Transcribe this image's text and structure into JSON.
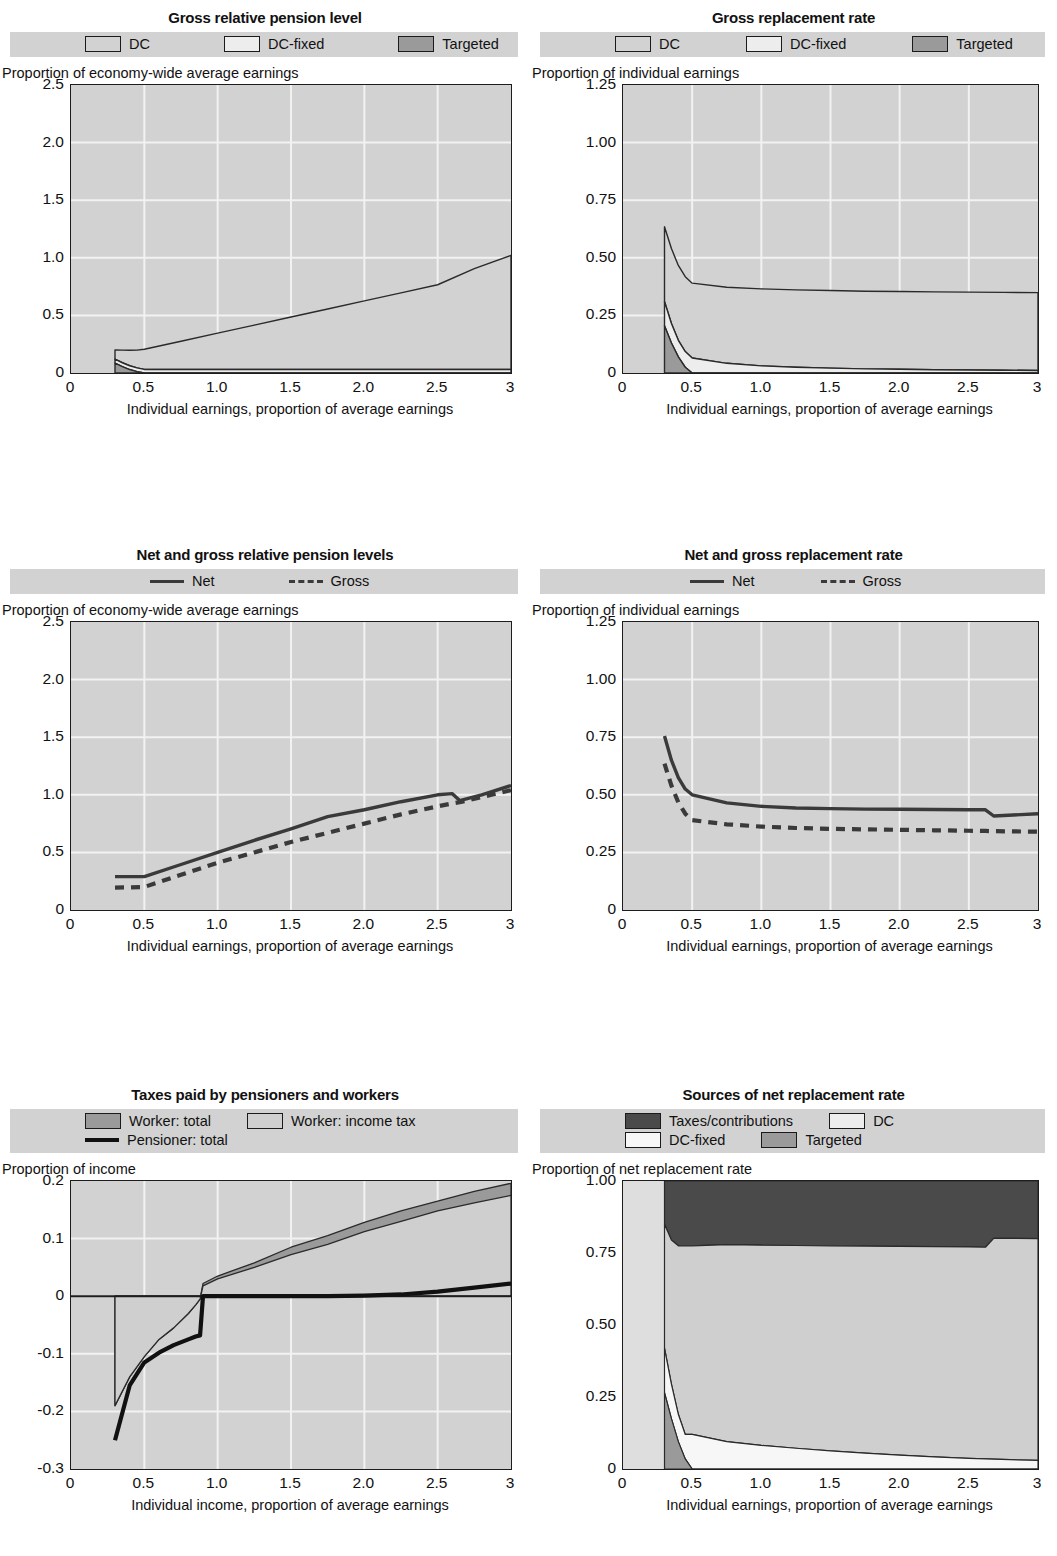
{
  "colors": {
    "page_bg": "#ffffff",
    "plot_bg": "#d2d2d2",
    "legend_bg": "#d2d2d2",
    "grid": "#f2f2f2",
    "axis": "#1d1d1d",
    "dc": "#d2d2d2",
    "dc_fixed": "#ededed",
    "targeted": "#9a9a9a",
    "taxes": "#4a4a4a",
    "worker_total": "#9a9a9a",
    "worker_income_tax": "#cfcfcf",
    "line_net": "#3a3a3a",
    "line_gross": "#3a3a3a",
    "line_pensioner": "#111111"
  },
  "panels": [
    {
      "id": "gross-relative-pension-level",
      "title": "Gross relative pension level",
      "legend_rows": [
        [
          {
            "label": "DC",
            "mark": "swatch",
            "fill": "#d2d2d2"
          },
          {
            "label": "DC-fixed",
            "mark": "swatch",
            "fill": "#ededed"
          },
          {
            "label": "Targeted",
            "mark": "swatch",
            "fill": "#9a9a9a"
          }
        ]
      ],
      "ylabel": "Proportion of economy-wide average earnings",
      "xlabel": "Individual earnings, proportion of average earnings"
    },
    {
      "id": "gross-replacement-rate",
      "title": "Gross replacement rate",
      "legend_rows": [
        [
          {
            "label": "DC",
            "mark": "swatch",
            "fill": "#d2d2d2"
          },
          {
            "label": "DC-fixed",
            "mark": "swatch",
            "fill": "#ededed"
          },
          {
            "label": "Targeted",
            "mark": "swatch",
            "fill": "#9a9a9a"
          }
        ]
      ],
      "ylabel": "Proportion of individual earnings",
      "xlabel": "Individual earnings, proportion of average earnings"
    },
    {
      "id": "net-and-gross-relative-pension-levels",
      "title": "Net and gross relative pension levels",
      "legend_rows": [
        [
          {
            "label": "Net",
            "mark": "line",
            "fill": "#3a3a3a"
          },
          {
            "label": "Gross",
            "mark": "dash",
            "fill": "#3a3a3a"
          }
        ]
      ],
      "ylabel": "Proportion of economy-wide average earnings",
      "xlabel": "Individual earnings, proportion of average earnings"
    },
    {
      "id": "net-and-gross-replacement-rate",
      "title": "Net and gross replacement rate",
      "legend_rows": [
        [
          {
            "label": "Net",
            "mark": "line",
            "fill": "#3a3a3a"
          },
          {
            "label": "Gross",
            "mark": "dash",
            "fill": "#3a3a3a"
          }
        ]
      ],
      "ylabel": "Proportion of individual earnings",
      "xlabel": "Individual earnings, proportion of average earnings"
    },
    {
      "id": "taxes-paid-by-pensioners-and-workers",
      "title": "Taxes paid by pensioners and workers",
      "legend_rows": [
        [
          {
            "label": "Worker: total",
            "mark": "swatch",
            "fill": "#9a9a9a"
          },
          {
            "label": "Worker: income tax",
            "mark": "swatch",
            "fill": "#cfcfcf"
          }
        ],
        [
          {
            "label": "Pensioner: total",
            "mark": "thickline",
            "fill": "#111111"
          }
        ]
      ],
      "ylabel": "Proportion of income",
      "xlabel": "Individual income, proportion of average earnings"
    },
    {
      "id": "sources-of-net-replacement-rate",
      "title": "Sources of net replacement rate",
      "legend_rows": [
        [
          {
            "label": "Taxes/contributions",
            "mark": "swatch",
            "fill": "#4a4a4a"
          },
          {
            "label": "DC",
            "mark": "swatch",
            "fill": "#ededed"
          }
        ],
        [
          {
            "label": "DC-fixed",
            "mark": "swatch",
            "fill": "#f7f7f7"
          },
          {
            "label": "Targeted",
            "mark": "swatch",
            "fill": "#9a9a9a"
          }
        ]
      ],
      "ylabel": "Proportion of net replacement rate",
      "xlabel": "Individual earnings, proportion of average earnings"
    }
  ],
  "chart_data": [
    {
      "type": "area",
      "id": "gross-relative-pension-level",
      "title": "Gross relative pension level",
      "xlabel": "Individual earnings, proportion of average earnings",
      "ylabel": "Proportion of economy-wide average earnings",
      "xlim": [
        0,
        3
      ],
      "ylim": [
        0,
        2.5
      ],
      "xticks": [
        0,
        0.5,
        1.0,
        1.5,
        2.0,
        2.5,
        3
      ],
      "xticklabels": [
        "0",
        "0.5",
        "1.0",
        "1.5",
        "2.0",
        "2.5",
        "3"
      ],
      "yticks": [
        0,
        0.5,
        1.0,
        1.5,
        2.0,
        2.5
      ],
      "yticklabels": [
        "0",
        "0.5",
        "1.0",
        "1.5",
        "2.0",
        "2.5"
      ],
      "grid": true,
      "stacked": true,
      "legend_position": "above",
      "x": [
        0.3,
        0.35,
        0.4,
        0.45,
        0.5,
        0.75,
        1.0,
        1.25,
        1.5,
        1.75,
        2.0,
        2.25,
        2.5,
        2.75,
        3.0
      ],
      "series": [
        {
          "name": "Targeted",
          "values": [
            0.085,
            0.055,
            0.03,
            0.012,
            0.0,
            0.0,
            0.0,
            0.0,
            0.0,
            0.0,
            0.0,
            0.0,
            0.0,
            0.0,
            0.0
          ]
        },
        {
          "name": "DC-fixed",
          "values": [
            0.035,
            0.034,
            0.033,
            0.032,
            0.031,
            0.031,
            0.031,
            0.031,
            0.031,
            0.031,
            0.031,
            0.031,
            0.031,
            0.031,
            0.031
          ]
        },
        {
          "name": "DC",
          "values": [
            0.08,
            0.11,
            0.135,
            0.155,
            0.175,
            0.245,
            0.315,
            0.385,
            0.455,
            0.525,
            0.595,
            0.665,
            0.735,
            0.875,
            0.99
          ]
        }
      ],
      "totals": [
        0.2,
        0.199,
        0.198,
        0.199,
        0.206,
        0.276,
        0.346,
        0.416,
        0.486,
        0.556,
        0.626,
        0.696,
        0.766,
        0.906,
        1.021
      ]
    },
    {
      "type": "area",
      "id": "gross-replacement-rate",
      "title": "Gross replacement rate",
      "xlabel": "Individual earnings, proportion of average earnings",
      "ylabel": "Proportion of individual earnings",
      "xlim": [
        0,
        3
      ],
      "ylim": [
        0,
        1.25
      ],
      "xticks": [
        0,
        0.5,
        1.0,
        1.5,
        2.0,
        2.5,
        3
      ],
      "xticklabels": [
        "0",
        "0.5",
        "1.0",
        "1.5",
        "2.0",
        "2.5",
        "3"
      ],
      "yticks": [
        0,
        0.25,
        0.5,
        0.75,
        1.0,
        1.25
      ],
      "yticklabels": [
        "0",
        "0.25",
        "0.50",
        "0.75",
        "1.00",
        "1.25"
      ],
      "grid": true,
      "stacked": true,
      "legend_position": "above",
      "x": [
        0.3,
        0.35,
        0.4,
        0.45,
        0.5,
        0.75,
        1.0,
        1.25,
        1.5,
        1.75,
        2.0,
        2.25,
        2.5,
        2.75,
        3.0
      ],
      "series": [
        {
          "name": "Targeted",
          "values": [
            0.205,
            0.13,
            0.07,
            0.025,
            0.0,
            0.0,
            0.0,
            0.0,
            0.0,
            0.0,
            0.0,
            0.0,
            0.0,
            0.0,
            0.0
          ]
        },
        {
          "name": "DC-fixed",
          "values": [
            0.105,
            0.085,
            0.072,
            0.068,
            0.065,
            0.042,
            0.031,
            0.025,
            0.021,
            0.018,
            0.016,
            0.014,
            0.013,
            0.012,
            0.011
          ]
        },
        {
          "name": "DC",
          "values": [
            0.325,
            0.325,
            0.325,
            0.325,
            0.325,
            0.33,
            0.334,
            0.336,
            0.337,
            0.337,
            0.338,
            0.338,
            0.338,
            0.338,
            0.338
          ]
        }
      ],
      "totals": [
        0.635,
        0.54,
        0.467,
        0.418,
        0.39,
        0.372,
        0.365,
        0.361,
        0.358,
        0.355,
        0.354,
        0.352,
        0.351,
        0.35,
        0.349
      ]
    },
    {
      "type": "line",
      "id": "net-and-gross-relative-pension-levels",
      "title": "Net and gross relative pension levels",
      "xlabel": "Individual earnings, proportion of average earnings",
      "ylabel": "Proportion of economy-wide average earnings",
      "xlim": [
        0,
        3
      ],
      "ylim": [
        0,
        2.5
      ],
      "xticks": [
        0,
        0.5,
        1.0,
        1.5,
        2.0,
        2.5,
        3
      ],
      "xticklabels": [
        "0",
        "0.5",
        "1.0",
        "1.5",
        "2.0",
        "2.5",
        "3"
      ],
      "yticks": [
        0,
        0.5,
        1.0,
        1.5,
        2.0,
        2.5
      ],
      "yticklabels": [
        "0",
        "0.5",
        "1.0",
        "1.5",
        "2.0",
        "2.5"
      ],
      "grid": true,
      "legend_position": "above",
      "x": [
        0.3,
        0.4,
        0.5,
        0.75,
        1.0,
        1.25,
        1.5,
        1.75,
        2.0,
        2.25,
        2.5,
        2.6,
        2.65,
        2.8,
        3.0
      ],
      "series": [
        {
          "name": "Net",
          "style": "solid",
          "values": [
            0.29,
            0.29,
            0.29,
            0.395,
            0.5,
            0.605,
            0.705,
            0.81,
            0.87,
            0.94,
            1.0,
            1.01,
            0.95,
            1.0,
            1.08
          ]
        },
        {
          "name": "Gross",
          "style": "dashed",
          "values": [
            0.195,
            0.197,
            0.2,
            0.305,
            0.41,
            0.5,
            0.59,
            0.67,
            0.75,
            0.83,
            0.9,
            0.925,
            0.935,
            0.98,
            1.04
          ]
        }
      ]
    },
    {
      "type": "line",
      "id": "net-and-gross-replacement-rate",
      "title": "Net and gross replacement rate",
      "xlabel": "Individual earnings, proportion of average earnings",
      "ylabel": "Proportion of individual earnings",
      "xlim": [
        0,
        3
      ],
      "ylim": [
        0,
        1.25
      ],
      "xticks": [
        0,
        0.5,
        1.0,
        1.5,
        2.0,
        2.5,
        3
      ],
      "xticklabels": [
        "0",
        "0.5",
        "1.0",
        "1.5",
        "2.0",
        "2.5",
        "3"
      ],
      "yticks": [
        0,
        0.25,
        0.5,
        0.75,
        1.0,
        1.25
      ],
      "yticklabels": [
        "0",
        "0.25",
        "0.50",
        "0.75",
        "1.00",
        "1.25"
      ],
      "grid": true,
      "legend_position": "above",
      "x": [
        0.3,
        0.35,
        0.4,
        0.45,
        0.5,
        0.75,
        1.0,
        1.25,
        1.5,
        1.75,
        2.0,
        2.25,
        2.5,
        2.62,
        2.68,
        3.0
      ],
      "series": [
        {
          "name": "Net",
          "style": "solid",
          "values": [
            0.755,
            0.65,
            0.575,
            0.525,
            0.5,
            0.465,
            0.45,
            0.443,
            0.44,
            0.438,
            0.437,
            0.436,
            0.435,
            0.435,
            0.408,
            0.418
          ]
        },
        {
          "name": "Gross",
          "style": "dashed",
          "values": [
            0.635,
            0.54,
            0.467,
            0.418,
            0.39,
            0.372,
            0.362,
            0.356,
            0.352,
            0.35,
            0.348,
            0.346,
            0.344,
            0.343,
            0.342,
            0.34
          ]
        }
      ]
    },
    {
      "type": "area",
      "id": "taxes-paid-by-pensioners-and-workers",
      "title": "Taxes paid by pensioners and workers",
      "xlabel": "Individual income, proportion of average earnings",
      "ylabel": "Proportion of income",
      "xlim": [
        0,
        3
      ],
      "ylim": [
        -0.3,
        0.2
      ],
      "xticks": [
        0,
        0.5,
        1.0,
        1.5,
        2.0,
        2.5,
        3
      ],
      "xticklabels": [
        "0",
        "0.5",
        "1.0",
        "1.5",
        "2.0",
        "2.5",
        "3"
      ],
      "yticks": [
        -0.3,
        -0.2,
        -0.1,
        0,
        0.1,
        0.2
      ],
      "yticklabels": [
        "-0.3",
        "-0.2",
        "-0.1",
        "0",
        "0.1",
        "0.2"
      ],
      "grid": true,
      "legend_position": "above",
      "x": [
        0.3,
        0.4,
        0.5,
        0.6,
        0.7,
        0.8,
        0.85,
        0.88,
        0.9,
        1.0,
        1.25,
        1.5,
        1.75,
        2.0,
        2.25,
        2.5,
        2.75,
        3.0
      ],
      "series": [
        {
          "name": "Worker: total",
          "values": [
            -0.19,
            -0.14,
            -0.105,
            -0.075,
            -0.055,
            -0.03,
            -0.015,
            -0.005,
            0.022,
            0.035,
            0.058,
            0.085,
            0.105,
            0.128,
            0.148,
            0.165,
            0.182,
            0.196
          ]
        },
        {
          "name": "Worker: income tax",
          "values": [
            -0.19,
            -0.14,
            -0.105,
            -0.075,
            -0.055,
            -0.03,
            -0.015,
            -0.005,
            0.018,
            0.03,
            0.05,
            0.072,
            0.09,
            0.112,
            0.13,
            0.148,
            0.162,
            0.175
          ]
        },
        {
          "name": "Pensioner: total",
          "style": "thickline",
          "values": [
            -0.25,
            -0.155,
            -0.115,
            -0.098,
            -0.085,
            -0.075,
            -0.07,
            -0.068,
            0.0,
            0.0,
            0.0,
            0.0,
            0.0,
            0.001,
            0.003,
            0.008,
            0.015,
            0.022
          ]
        }
      ]
    },
    {
      "type": "area",
      "id": "sources-of-net-replacement-rate",
      "title": "Sources of net replacement rate",
      "xlabel": "Individual earnings, proportion of average earnings",
      "ylabel": "Proportion of net replacement rate",
      "xlim": [
        0,
        3
      ],
      "ylim": [
        0,
        1.0
      ],
      "xticks": [
        0,
        0.5,
        1.0,
        1.5,
        2.0,
        2.5,
        3
      ],
      "xticklabels": [
        "0",
        "0.5",
        "1.0",
        "1.5",
        "2.0",
        "2.5",
        "3"
      ],
      "yticks": [
        0,
        0.25,
        0.5,
        0.75,
        1.0
      ],
      "yticklabels": [
        "0",
        "0.25",
        "0.50",
        "0.75",
        "1.00"
      ],
      "grid": true,
      "stacked": true,
      "legend_position": "above",
      "x": [
        0.3,
        0.35,
        0.4,
        0.45,
        0.5,
        0.75,
        1.0,
        1.25,
        1.5,
        1.75,
        2.0,
        2.25,
        2.5,
        2.62,
        2.68,
        3.0
      ],
      "series": [
        {
          "name": "Targeted",
          "values": [
            0.265,
            0.175,
            0.095,
            0.035,
            0.0,
            0.0,
            0.0,
            0.0,
            0.0,
            0.0,
            0.0,
            0.0,
            0.0,
            0.0,
            0.0,
            0.0
          ]
        },
        {
          "name": "DC-fixed",
          "values": [
            0.155,
            0.12,
            0.095,
            0.085,
            0.12,
            0.095,
            0.082,
            0.072,
            0.063,
            0.055,
            0.048,
            0.042,
            0.037,
            0.035,
            0.034,
            0.03
          ]
        },
        {
          "name": "DC",
          "values": [
            0.43,
            0.5,
            0.585,
            0.655,
            0.655,
            0.684,
            0.695,
            0.704,
            0.712,
            0.719,
            0.725,
            0.73,
            0.734,
            0.735,
            0.767,
            0.77
          ]
        },
        {
          "name": "Taxes/contributions",
          "values": [
            0.15,
            0.205,
            0.225,
            0.225,
            0.225,
            0.221,
            0.223,
            0.224,
            0.225,
            0.226,
            0.227,
            0.228,
            0.229,
            0.23,
            0.199,
            0.2
          ]
        }
      ]
    }
  ]
}
